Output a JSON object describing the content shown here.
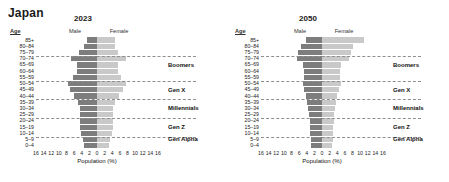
{
  "title": "Japan",
  "axis": {
    "xlabel": "Population (%)",
    "age_header": "Age",
    "male_label": "Male",
    "female_label": "Female",
    "xticks": [
      16,
      14,
      12,
      10,
      8,
      6,
      4,
      2,
      0,
      2,
      4,
      6,
      8,
      10,
      12,
      14,
      16
    ],
    "xmax": 16
  },
  "colors": {
    "male": "#7d7d7d",
    "female": "#c9c9c9",
    "grid": "#8f8f8f",
    "text": "#1a1a1a"
  },
  "age_groups": [
    "85+",
    "80–84",
    "75–79",
    "70–74",
    "65–69",
    "60–64",
    "55–59",
    "50–54",
    "45–49",
    "40–44",
    "35–39",
    "30–34",
    "25–29",
    "20–24",
    "15–19",
    "10–14",
    "5–9",
    "0–4"
  ],
  "generations": [
    {
      "label": "Boomers",
      "boundary_after": "75–79",
      "center_group": "65–69"
    },
    {
      "label": "Gen X",
      "boundary_after": "55–59",
      "center_group": "45–49"
    },
    {
      "label": "Millennials",
      "boundary_after": "40–44",
      "center_group": "30–34"
    },
    {
      "label": "Gen Z",
      "boundary_after": "25–29",
      "center_group": "15–19"
    },
    {
      "label": "Gen Alpha",
      "boundary_after": "10–14",
      "center_group": "5–9"
    }
  ],
  "chart_data": [
    {
      "type": "bar",
      "title": "2023",
      "subtype": "population-pyramid",
      "xlabel": "Population (%)",
      "ylabel": "Age",
      "xlim": [
        -16,
        16
      ],
      "grid": true,
      "legend": [
        "Male",
        "Female"
      ],
      "legend_position": "top",
      "categories": [
        "85+",
        "80–84",
        "75–79",
        "70–74",
        "65–69",
        "60–64",
        "55–59",
        "50–54",
        "45–49",
        "40–44",
        "35–39",
        "30–34",
        "25–29",
        "20–24",
        "15–19",
        "10–14",
        "5–9",
        "0–4"
      ],
      "series": [
        {
          "name": "Male",
          "values": [
            2.6,
            3.4,
            4.8,
            6.9,
            5.2,
            5.3,
            6.2,
            7.6,
            7.1,
            6.0,
            5.1,
            4.5,
            4.5,
            4.5,
            4.4,
            4.1,
            3.7,
            3.4
          ]
        },
        {
          "name": "Female",
          "values": [
            4.6,
            4.7,
            5.6,
            7.5,
            5.5,
            5.5,
            6.2,
            7.5,
            6.9,
            5.7,
            4.8,
            4.2,
            4.2,
            4.3,
            4.2,
            3.9,
            3.5,
            3.2
          ]
        }
      ]
    },
    {
      "type": "bar",
      "title": "2050",
      "subtype": "population-pyramid",
      "xlabel": "Population (%)",
      "ylabel": "Age",
      "xlim": [
        -16,
        16
      ],
      "grid": true,
      "legend": [
        "Male",
        "Female"
      ],
      "legend_position": "top",
      "categories": [
        "85+",
        "80–84",
        "75–79",
        "70–74",
        "65–69",
        "60–64",
        "55–59",
        "50–54",
        "45–49",
        "40–44",
        "35–39",
        "30–34",
        "25–29",
        "20–24",
        "15–19",
        "10–14",
        "5–9",
        "0–4"
      ],
      "series": [
        {
          "name": "Male",
          "values": [
            4.2,
            5.4,
            6.3,
            6.5,
            4.9,
            4.6,
            4.8,
            5.0,
            4.6,
            4.2,
            3.9,
            3.6,
            3.4,
            3.2,
            3.2,
            3.1,
            2.9,
            2.8
          ]
        },
        {
          "name": "Female",
          "values": [
            10.9,
            8.1,
            7.6,
            7.2,
            5.1,
            4.7,
            4.8,
            4.9,
            4.5,
            4.0,
            3.7,
            3.4,
            3.2,
            3.1,
            3.0,
            2.9,
            2.8,
            2.6
          ]
        }
      ]
    }
  ]
}
